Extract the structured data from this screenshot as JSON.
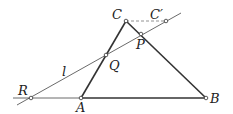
{
  "diagram": {
    "points": {
      "C": {
        "label": "C",
        "x": 126,
        "y": 21
      },
      "C_prime": {
        "label": "C′",
        "x": 166,
        "y": 21
      },
      "P": {
        "label": "P",
        "x": 141,
        "y": 34
      },
      "Q": {
        "label": "Q",
        "x": 106,
        "y": 55
      },
      "R": {
        "label": "R",
        "x": 31,
        "y": 98
      },
      "A": {
        "label": "A",
        "x": 81,
        "y": 98
      },
      "B": {
        "label": "B",
        "x": 206,
        "y": 98
      }
    },
    "line_label": "l",
    "colors": {
      "stroke": "#333333",
      "dashed": "#777777",
      "fill": "#ffffff"
    }
  }
}
